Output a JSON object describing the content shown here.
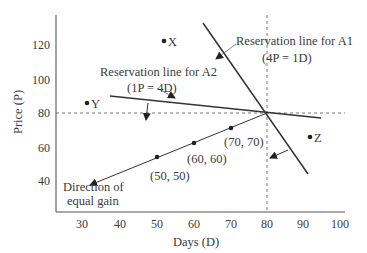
{
  "diagram": {
    "x_axis_label": "Days (D)",
    "y_axis_label": "Price (P)",
    "x_ticks": [
      "30",
      "40",
      "50",
      "60",
      "70",
      "80",
      "90",
      "100"
    ],
    "y_ticks": [
      "120",
      "100",
      "80",
      "60",
      "40"
    ],
    "a1_label_line1": "Reservation line for A1",
    "a1_label_line2": "(4P = 1D)",
    "a2_label_line1": "Reservation line for A2",
    "a2_label_line2": "(1P = 4D)",
    "points": {
      "x": "X",
      "y": "Y",
      "z": "Z"
    },
    "gain_points": [
      "(50, 50)",
      "(60, 60)",
      "(70, 70)"
    ],
    "direction_line1": "Direction of",
    "direction_line2": "equal gain",
    "intersection": {
      "days": 80,
      "price": 80
    }
  }
}
